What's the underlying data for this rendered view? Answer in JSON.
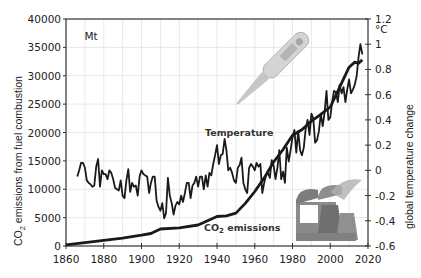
{
  "chart_data": {
    "type": "line",
    "title": "",
    "xlabel": "",
    "ylabel": "CO2 emissions from fuel combustion",
    "ylabel_unit": "Mt",
    "y2label": "global temperature change",
    "y2label_unit": "°C",
    "xlim": [
      1860,
      2020
    ],
    "ylim": [
      0,
      40000
    ],
    "y2lim": [
      -0.6,
      1.2
    ],
    "x_ticks": [
      "1860",
      "1880",
      "1900",
      "1920",
      "1940",
      "1960",
      "1980",
      "2000",
      "2020"
    ],
    "y_ticks": [
      "0",
      "5000",
      "10000",
      "15000",
      "20000",
      "25000",
      "30000",
      "35000",
      "40000"
    ],
    "y2_ticks": [
      "-0.6",
      "-0.4",
      "-0.2",
      "0",
      "0.2",
      "0.4",
      "0.6",
      "0.8",
      "1",
      "1.2"
    ],
    "grid": true,
    "legend": "none (inline annotations)",
    "annotations": [
      "Temperature",
      "CO2 emissions"
    ],
    "series": [
      {
        "name": "CO2 emissions",
        "axis": "left",
        "x": [
          1860,
          1870,
          1880,
          1890,
          1900,
          1905,
          1910,
          1920,
          1930,
          1940,
          1945,
          1950,
          1955,
          1960,
          1965,
          1970,
          1975,
          1980,
          1985,
          1990,
          1995,
          2000,
          2005,
          2010,
          2013,
          2015,
          2017
        ],
        "values": [
          200,
          600,
          1000,
          1400,
          1900,
          2200,
          3000,
          3200,
          3700,
          5200,
          5300,
          5800,
          7500,
          9600,
          12000,
          14800,
          17000,
          19500,
          20500,
          22000,
          23200,
          24500,
          28000,
          31500,
          32400,
          32200,
          32800
        ]
      },
      {
        "name": "Temperature",
        "axis": "right",
        "x": [
          1866,
          1867,
          1868,
          1869,
          1870,
          1871,
          1872,
          1873,
          1874,
          1875,
          1876,
          1877,
          1878,
          1879,
          1880,
          1881,
          1882,
          1883,
          1884,
          1885,
          1886,
          1887,
          1888,
          1889,
          1890,
          1891,
          1892,
          1893,
          1894,
          1895,
          1896,
          1897,
          1898,
          1899,
          1900,
          1901,
          1902,
          1903,
          1904,
          1905,
          1906,
          1907,
          1908,
          1909,
          1910,
          1911,
          1912,
          1913,
          1914,
          1915,
          1916,
          1917,
          1918,
          1919,
          1920,
          1921,
          1922,
          1923,
          1924,
          1925,
          1926,
          1927,
          1928,
          1929,
          1930,
          1931,
          1932,
          1933,
          1934,
          1935,
          1936,
          1937,
          1938,
          1939,
          1940,
          1941,
          1942,
          1943,
          1944,
          1945,
          1946,
          1947,
          1948,
          1949,
          1950,
          1951,
          1952,
          1953,
          1954,
          1955,
          1956,
          1957,
          1958,
          1959,
          1960,
          1961,
          1962,
          1963,
          1964,
          1965,
          1966,
          1967,
          1968,
          1969,
          1970,
          1971,
          1972,
          1973,
          1974,
          1975,
          1976,
          1977,
          1978,
          1979,
          1980,
          1981,
          1982,
          1983,
          1984,
          1985,
          1986,
          1987,
          1988,
          1989,
          1990,
          1991,
          1992,
          1993,
          1994,
          1995,
          1996,
          1997,
          1998,
          1999,
          2000,
          2001,
          2002,
          2003,
          2004,
          2005,
          2006,
          2007,
          2008,
          2009,
          2010,
          2011,
          2012,
          2013,
          2014,
          2015,
          2016,
          2017
        ],
        "values": [
          -0.05,
          0.0,
          0.06,
          0.06,
          0.02,
          -0.08,
          -0.1,
          -0.11,
          -0.13,
          -0.12,
          0.03,
          0.09,
          -0.13,
          0.0,
          -0.03,
          -0.03,
          -0.07,
          0.0,
          -0.02,
          -0.07,
          -0.14,
          -0.15,
          -0.16,
          -0.08,
          -0.2,
          -0.22,
          -0.08,
          0.01,
          -0.17,
          -0.1,
          -0.13,
          -0.12,
          -0.2,
          -0.05,
          0.0,
          -0.03,
          -0.04,
          -0.05,
          -0.18,
          -0.1,
          -0.05,
          -0.05,
          -0.24,
          -0.29,
          -0.32,
          -0.26,
          -0.38,
          -0.34,
          -0.06,
          -0.2,
          -0.26,
          -0.35,
          -0.28,
          -0.25,
          -0.27,
          -0.2,
          -0.25,
          -0.18,
          -0.1,
          -0.1,
          -0.22,
          -0.12,
          -0.1,
          -0.05,
          -0.13,
          -0.05,
          -0.05,
          -0.15,
          -0.04,
          -0.13,
          -0.02,
          -0.04,
          0.05,
          0.12,
          0.2,
          0.05,
          0.12,
          0.13,
          0.25,
          0.16,
          0.0,
          0.02,
          -0.02,
          -0.08,
          -0.1,
          0.02,
          0.04,
          0.1,
          -0.1,
          -0.15,
          -0.18,
          0.02,
          0.05,
          0.03,
          0.0,
          0.06,
          0.03,
          0.05,
          -0.18,
          -0.1,
          -0.04,
          -0.02,
          -0.06,
          0.08,
          0.04,
          -0.07,
          0.02,
          0.16,
          -0.07,
          -0.01,
          -0.1,
          0.18,
          0.07,
          0.16,
          0.26,
          0.32,
          0.14,
          0.31,
          0.16,
          0.12,
          0.18,
          0.33,
          0.4,
          0.28,
          0.45,
          0.41,
          0.22,
          0.24,
          0.31,
          0.45,
          0.35,
          0.46,
          0.63,
          0.4,
          0.42,
          0.54,
          0.63,
          0.62,
          0.54,
          0.68,
          0.61,
          0.66,
          0.54,
          0.64,
          0.72,
          0.61,
          0.64,
          0.68,
          0.75,
          0.9,
          1.0,
          0.92
        ]
      }
    ]
  },
  "labels": {
    "temperature_annotation": "Temperature",
    "co2_annotation_prefix": "CO",
    "co2_annotation_sub": "2",
    "co2_annotation_suffix": " emissions",
    "left_unit": "Mt",
    "right_unit": "°C",
    "left_axis_title_prefix": "CO",
    "left_axis_title_sub": "2",
    "left_axis_title_suffix": " emissions from fuel combustion",
    "right_axis_title": "global temperature change"
  },
  "colors": {
    "line": "#1a1a1a",
    "grid": "#e2e2e2",
    "axis": "#333333",
    "thermometer": "#c8c8c8",
    "factory": "#7a7a7a"
  }
}
